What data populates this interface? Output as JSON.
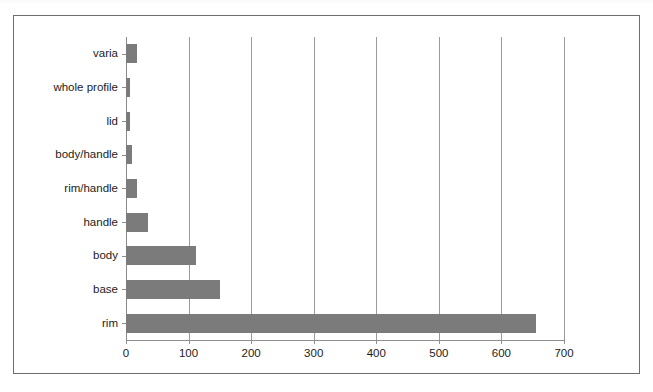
{
  "chart_data": {
    "type": "bar",
    "orientation": "horizontal",
    "title": "",
    "subtitle": "",
    "xlabel": "",
    "ylabel": "",
    "categories": [
      "rim",
      "base",
      "body",
      "handle",
      "rim/handle",
      "body/handle",
      "lid",
      "whole profile",
      "varia"
    ],
    "values": [
      655,
      150,
      112,
      35,
      18,
      9,
      6,
      6,
      18
    ],
    "series": [
      {
        "name": "count",
        "values": [
          655,
          150,
          112,
          35,
          18,
          9,
          6,
          6,
          18
        ]
      }
    ],
    "xlim": [
      0,
      700
    ],
    "xticks": [
      0,
      100,
      200,
      300,
      400,
      500,
      600,
      700
    ],
    "xtick_labels": [
      "0",
      "100",
      "200",
      "300",
      "400",
      "500",
      "600",
      "700"
    ],
    "grid": "vertical",
    "legend": "none",
    "bar_color": "#7b7b7b",
    "grid_color": "#9a9a9a",
    "axis_color": "#8f8f8f",
    "frame_color": "#6e6e6e",
    "background": "#ffffff"
  }
}
